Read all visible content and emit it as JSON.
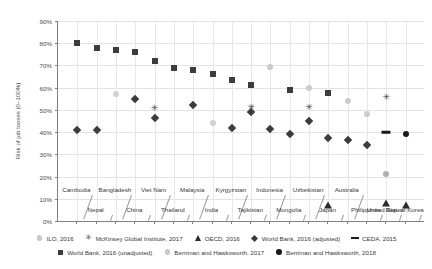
{
  "chart_data": {
    "type": "scatter",
    "title": "",
    "xlabel": "",
    "ylabel": "Risk of job losses (0–100%)",
    "ylim": [
      0,
      90
    ],
    "ytick_labels": [
      "0%",
      "10%",
      "20%",
      "30%",
      "40%",
      "50%",
      "60%",
      "70%",
      "80%",
      "90%"
    ],
    "ytick_values": [
      0,
      10,
      20,
      30,
      40,
      50,
      60,
      70,
      80,
      90
    ],
    "grid": true,
    "legend_position": "bottom",
    "categories": [
      "Cambodia",
      "Nepal",
      "Bangladesh",
      "China",
      "Viet Nam",
      "Thailand",
      "Malaysia",
      "India",
      "Kyrgyzstan",
      "Tajikistan",
      "Indonesia",
      "Mongolia",
      "Uzbekistan",
      "Japan",
      "Australia",
      "Philippines",
      "United States",
      "Rep. of Korea"
    ],
    "categories_upper": [
      "Cambodia",
      "Bangladesh",
      "Viet Nam",
      "Malaysia",
      "Kyrgyzstan",
      "Indonesia",
      "Uzbekistan",
      "Australia"
    ],
    "categories_lower": [
      "Nepal",
      "China",
      "Thailand",
      "India",
      "Tajikistan",
      "Mongolia",
      "Japan",
      "Philippines",
      "United States",
      "Rep. of Korea"
    ],
    "series": [
      {
        "name": "ILO, 2016",
        "marker": "circle",
        "color": "#c9c9c9",
        "values": [
          null,
          null,
          57,
          null,
          null,
          null,
          null,
          44,
          null,
          null,
          null,
          null,
          null,
          null,
          null,
          null,
          null,
          null
        ]
      },
      {
        "name": "McKinsey Global Institute, 2017",
        "marker": "star",
        "color": "#555555",
        "values": [
          null,
          null,
          null,
          null,
          51,
          null,
          null,
          null,
          null,
          null,
          51.5,
          null,
          null,
          null,
          51.5,
          null,
          null,
          null
        ]
      },
      {
        "name": "OECD, 2016",
        "marker": "triangle",
        "color": "#2b2b2b",
        "values": [
          null,
          null,
          null,
          null,
          null,
          null,
          null,
          null,
          null,
          null,
          null,
          null,
          null,
          7,
          null,
          null,
          7,
          6
        ]
      },
      {
        "name": "World Bank, 2016 (adjusted)",
        "marker": "diamond",
        "color": "#3c3c3c",
        "values": [
          41,
          41,
          55,
          47,
          46.5,
          null,
          52,
          48.5,
          38,
          36,
          43.5,
          null,
          34,
          null,
          null,
          null,
          null,
          null
        ]
      },
      {
        "name": "CEDA, 2015",
        "marker": "dash",
        "color": "#1a1a1a",
        "values": [
          null,
          null,
          null,
          null,
          null,
          null,
          null,
          null,
          null,
          null,
          null,
          null,
          null,
          null,
          40,
          null,
          null,
          null
        ]
      },
      {
        "name": "World Bank, 2016 (unadjusted)",
        "marker": "square",
        "color": "#3c3c3c",
        "values": [
          80,
          78,
          76.8,
          76,
          72,
          69,
          67.8,
          65,
          63.5,
          61,
          59,
          57.5,
          null,
          55,
          null,
          null,
          null,
          null
        ]
      },
      {
        "name": "Berriman and Hawksworth, 2017",
        "marker": "circle",
        "color": "#c9c9c9",
        "values": [
          null,
          null,
          null,
          null,
          null,
          null,
          null,
          null,
          null,
          null,
          69.5,
          null,
          null,
          54,
          48,
          21,
          null,
          null
        ]
      },
      {
        "name": "Berriman and Hawksworth, 2018",
        "marker": "circle-dark",
        "color": "#1a1a1a",
        "values": [
          null,
          null,
          null,
          null,
          null,
          null,
          null,
          null,
          null,
          null,
          null,
          null,
          null,
          null,
          null,
          null,
          39,
          null
        ]
      }
    ],
    "points": [
      {
        "series": 5,
        "cat": 0,
        "value": 80,
        "marker": "square",
        "color": "#3c3c3c"
      },
      {
        "series": 5,
        "cat": 1,
        "value": 78,
        "marker": "square",
        "color": "#3c3c3c"
      },
      {
        "series": 5,
        "cat": 2,
        "value": 76.8,
        "marker": "square",
        "color": "#3c3c3c"
      },
      {
        "series": 5,
        "cat": 3,
        "value": 76,
        "marker": "square",
        "color": "#3c3c3c"
      },
      {
        "series": 5,
        "cat": 4,
        "value": 72,
        "marker": "square",
        "color": "#3c3c3c"
      },
      {
        "series": 5,
        "cat": 5,
        "value": 69,
        "marker": "square",
        "color": "#3c3c3c"
      },
      {
        "series": 5,
        "cat": 6,
        "value": 67.8,
        "marker": "square",
        "color": "#3c3c3c"
      },
      {
        "series": 5,
        "cat": 7,
        "value": 66,
        "marker": "square",
        "color": "#3c3c3c"
      },
      {
        "series": 5,
        "cat": 8,
        "value": 63.5,
        "marker": "square",
        "color": "#3c3c3c"
      },
      {
        "series": 5,
        "cat": 9,
        "value": 61,
        "marker": "square",
        "color": "#3c3c3c"
      },
      {
        "series": 5,
        "cat": 11,
        "value": 59,
        "marker": "square",
        "color": "#3c3c3c"
      },
      {
        "series": 5,
        "cat": 13,
        "value": 57.5,
        "marker": "square",
        "color": "#3c3c3c"
      },
      {
        "series": 6,
        "cat": 10,
        "value": 69.5,
        "marker": "circle",
        "color": "#cccccc"
      },
      {
        "series": 6,
        "cat": 12,
        "value": 60,
        "marker": "circle",
        "color": "#cccccc"
      },
      {
        "series": 6,
        "cat": 14,
        "value": 54,
        "marker": "circle",
        "color": "#cccccc"
      },
      {
        "series": 6,
        "cat": 15,
        "value": 48,
        "marker": "circle",
        "color": "#cccccc"
      },
      {
        "series": 6,
        "cat": 16,
        "value": 21,
        "marker": "circle",
        "color": "#b0b0b0"
      },
      {
        "series": 0,
        "cat": 2,
        "value": 57,
        "marker": "circle",
        "color": "#d2d2d2"
      },
      {
        "series": 0,
        "cat": 7,
        "value": 44,
        "marker": "circle",
        "color": "#d2d2d2"
      },
      {
        "series": 1,
        "cat": 4,
        "value": 51,
        "marker": "star",
        "color": "#4a4a4a"
      },
      {
        "series": 1,
        "cat": 9,
        "value": 51.5,
        "marker": "star",
        "color": "#4a4a4a"
      },
      {
        "series": 1,
        "cat": 12,
        "value": 51.5,
        "marker": "star",
        "color": "#4a4a4a"
      },
      {
        "series": 1,
        "cat": 16,
        "value": 56,
        "marker": "star",
        "color": "#4a4a4a"
      },
      {
        "series": 3,
        "cat": 0,
        "value": 41,
        "marker": "diamond",
        "color": "#3c3c3c"
      },
      {
        "series": 3,
        "cat": 1,
        "value": 41,
        "marker": "diamond",
        "color": "#3c3c3c"
      },
      {
        "series": 3,
        "cat": 3,
        "value": 55,
        "marker": "diamond",
        "color": "#3c3c3c"
      },
      {
        "series": 3,
        "cat": 4,
        "value": 46.5,
        "marker": "diamond",
        "color": "#3c3c3c"
      },
      {
        "series": 3,
        "cat": 6,
        "value": 52,
        "marker": "diamond",
        "color": "#3c3c3c"
      },
      {
        "series": 3,
        "cat": 8,
        "value": 42,
        "marker": "diamond",
        "color": "#3c3c3c"
      },
      {
        "series": 3,
        "cat": 9,
        "value": 49,
        "marker": "diamond",
        "color": "#3c3c3c"
      },
      {
        "series": 3,
        "cat": 10,
        "value": 41.5,
        "marker": "diamond",
        "color": "#3c3c3c"
      },
      {
        "series": 3,
        "cat": 11,
        "value": 39,
        "marker": "diamond",
        "color": "#3c3c3c"
      },
      {
        "series": 3,
        "cat": 12,
        "value": 45,
        "marker": "diamond",
        "color": "#3c3c3c"
      },
      {
        "series": 3,
        "cat": 13,
        "value": 37.5,
        "marker": "diamond",
        "color": "#3c3c3c"
      },
      {
        "series": 3,
        "cat": 14,
        "value": 36.5,
        "marker": "diamond",
        "color": "#3c3c3c"
      },
      {
        "series": 3,
        "cat": 15,
        "value": 34,
        "marker": "diamond",
        "color": "#3c3c3c"
      },
      {
        "series": 4,
        "cat": 16,
        "value": 40,
        "marker": "dash",
        "color": "#1a1a1a"
      },
      {
        "series": 7,
        "cat": 17,
        "value": 39,
        "marker": "circle-dark",
        "color": "#1a1a1a"
      },
      {
        "series": 2,
        "cat": 13,
        "value": 7,
        "marker": "triangle",
        "color": "#2b2b2b"
      },
      {
        "series": 2,
        "cat": 16,
        "value": 8,
        "marker": "triangle",
        "color": "#2b2b2b"
      },
      {
        "series": 2,
        "cat": 17,
        "value": 7,
        "marker": "triangle",
        "color": "#2b2b2b"
      }
    ]
  },
  "legend": {
    "row1": [
      {
        "label": "ILO, 2016",
        "marker": "circle",
        "color": "#c9c9c9"
      },
      {
        "label": "McKinsey Global Institute, 2017",
        "marker": "star",
        "color": "#4a4a4a"
      },
      {
        "label": "OECD, 2016",
        "marker": "triangle",
        "color": "#2b2b2b"
      },
      {
        "label": "World Bank, 2016 (adjusted)",
        "marker": "diamond",
        "color": "#3c3c3c"
      },
      {
        "label": "CEDA, 2015",
        "marker": "dash",
        "color": "#1a1a1a"
      }
    ],
    "row2": [
      {
        "label": "World Bank, 2016 (unadjusted)",
        "marker": "square",
        "color": "#3c3c3c"
      },
      {
        "label": "Berriman and Hawksworth, 2017",
        "marker": "circle",
        "color": "#c9c9c9"
      },
      {
        "label": "Berriman and Hawksworth, 2018",
        "marker": "circle",
        "color": "#1a1a1a"
      }
    ]
  }
}
